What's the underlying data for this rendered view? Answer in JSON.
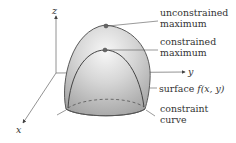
{
  "figure": {
    "type": "3d-surface-diagram",
    "axes": {
      "z_label": "z",
      "y_label": "y",
      "x_label": "x"
    },
    "annotations": {
      "unconstrained_max": [
        "unconstrained",
        "maximum"
      ],
      "constrained_max": [
        "constrained",
        "maximum"
      ],
      "surface_prefix": "surface ",
      "surface_func": "f(x, y)",
      "constraint_curve": [
        "constraint",
        "curve"
      ]
    },
    "colors": {
      "axis": "#555555",
      "dome_fill_light": "#f2f2f2",
      "dome_fill_dark": "#a9a9a9",
      "dome_outline": "#5a5a5a",
      "curve": "#444444",
      "point": "#666666",
      "text": "#333333"
    }
  }
}
